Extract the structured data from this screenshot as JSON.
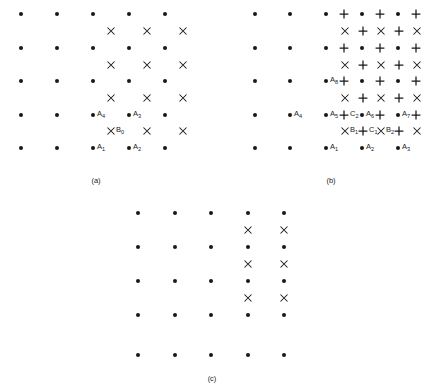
{
  "figure": {
    "background_color": "#ffffff",
    "mark_color": "#181818",
    "panels": [
      {
        "id": "panel-a",
        "caption": "(a)",
        "caption_x": 96,
        "caption_y": 176,
        "dots": [
          {
            "x": 21,
            "y": 14
          },
          {
            "x": 57,
            "y": 14
          },
          {
            "x": 93,
            "y": 14
          },
          {
            "x": 129,
            "y": 14
          },
          {
            "x": 165,
            "y": 14
          },
          {
            "x": 21,
            "y": 48
          },
          {
            "x": 57,
            "y": 48
          },
          {
            "x": 93,
            "y": 48
          },
          {
            "x": 129,
            "y": 48
          },
          {
            "x": 165,
            "y": 48
          },
          {
            "x": 21,
            "y": 81
          },
          {
            "x": 57,
            "y": 81
          },
          {
            "x": 93,
            "y": 81
          },
          {
            "x": 129,
            "y": 81
          },
          {
            "x": 165,
            "y": 81
          },
          {
            "x": 21,
            "y": 115
          },
          {
            "x": 57,
            "y": 115
          },
          {
            "x": 93,
            "y": 115
          },
          {
            "x": 129,
            "y": 115
          },
          {
            "x": 165,
            "y": 115
          },
          {
            "x": 21,
            "y": 148
          },
          {
            "x": 57,
            "y": 148
          },
          {
            "x": 93,
            "y": 148
          },
          {
            "x": 129,
            "y": 148
          },
          {
            "x": 165,
            "y": 148
          }
        ],
        "crosses": [
          {
            "x": 111,
            "y": 31
          },
          {
            "x": 147,
            "y": 31
          },
          {
            "x": 183,
            "y": 31
          },
          {
            "x": 111,
            "y": 65
          },
          {
            "x": 147,
            "y": 65
          },
          {
            "x": 183,
            "y": 65
          },
          {
            "x": 111,
            "y": 98
          },
          {
            "x": 147,
            "y": 98
          },
          {
            "x": 183,
            "y": 98
          },
          {
            "x": 111,
            "y": 131
          },
          {
            "x": 147,
            "y": 131
          },
          {
            "x": 183,
            "y": 131
          }
        ],
        "pluses": [],
        "labels": [
          {
            "text": "A",
            "sub": "4",
            "x": 97,
            "y": 115
          },
          {
            "text": "A",
            "sub": "3",
            "x": 133,
            "y": 115
          },
          {
            "text": "B",
            "sub": "0",
            "x": 116,
            "y": 131
          },
          {
            "text": "A",
            "sub": "1",
            "x": 97,
            "y": 148
          },
          {
            "text": "A",
            "sub": "2",
            "x": 133,
            "y": 148
          }
        ]
      },
      {
        "id": "panel-b",
        "caption": "(b)",
        "caption_x": 331,
        "caption_y": 176,
        "dots": [
          {
            "x": 255,
            "y": 14
          },
          {
            "x": 290,
            "y": 14
          },
          {
            "x": 326,
            "y": 14
          },
          {
            "x": 362,
            "y": 14
          },
          {
            "x": 398,
            "y": 14
          },
          {
            "x": 255,
            "y": 48
          },
          {
            "x": 290,
            "y": 48
          },
          {
            "x": 326,
            "y": 48
          },
          {
            "x": 362,
            "y": 48
          },
          {
            "x": 398,
            "y": 48
          },
          {
            "x": 255,
            "y": 81
          },
          {
            "x": 290,
            "y": 81
          },
          {
            "x": 326,
            "y": 81
          },
          {
            "x": 362,
            "y": 81
          },
          {
            "x": 398,
            "y": 81
          },
          {
            "x": 255,
            "y": 115
          },
          {
            "x": 290,
            "y": 115
          },
          {
            "x": 326,
            "y": 115
          },
          {
            "x": 362,
            "y": 115
          },
          {
            "x": 398,
            "y": 115
          },
          {
            "x": 255,
            "y": 148
          },
          {
            "x": 290,
            "y": 148
          },
          {
            "x": 326,
            "y": 148
          },
          {
            "x": 362,
            "y": 148
          },
          {
            "x": 398,
            "y": 148
          }
        ],
        "crosses": [
          {
            "x": 345,
            "y": 31
          },
          {
            "x": 381,
            "y": 31
          },
          {
            "x": 417,
            "y": 31
          },
          {
            "x": 345,
            "y": 65
          },
          {
            "x": 381,
            "y": 65
          },
          {
            "x": 417,
            "y": 65
          },
          {
            "x": 345,
            "y": 98
          },
          {
            "x": 381,
            "y": 98
          },
          {
            "x": 417,
            "y": 98
          },
          {
            "x": 345,
            "y": 131
          },
          {
            "x": 381,
            "y": 131
          },
          {
            "x": 417,
            "y": 131
          }
        ],
        "pluses": [
          {
            "x": 344,
            "y": 14
          },
          {
            "x": 380,
            "y": 14
          },
          {
            "x": 416,
            "y": 14
          },
          {
            "x": 363,
            "y": 31
          },
          {
            "x": 399,
            "y": 31
          },
          {
            "x": 344,
            "y": 48
          },
          {
            "x": 380,
            "y": 48
          },
          {
            "x": 416,
            "y": 48
          },
          {
            "x": 363,
            "y": 65
          },
          {
            "x": 399,
            "y": 65
          },
          {
            "x": 344,
            "y": 81
          },
          {
            "x": 380,
            "y": 81
          },
          {
            "x": 416,
            "y": 81
          },
          {
            "x": 363,
            "y": 98
          },
          {
            "x": 399,
            "y": 98
          },
          {
            "x": 344,
            "y": 115
          },
          {
            "x": 380,
            "y": 115
          },
          {
            "x": 416,
            "y": 115
          },
          {
            "x": 363,
            "y": 131
          },
          {
            "x": 399,
            "y": 131
          }
        ],
        "labels": [
          {
            "text": "A",
            "sub": "8",
            "x": 330,
            "y": 81
          },
          {
            "text": "A",
            "sub": "4",
            "x": 294,
            "y": 115
          },
          {
            "text": "A",
            "sub": "5",
            "x": 330,
            "y": 115
          },
          {
            "text": "C",
            "sub": "2",
            "x": 350,
            "y": 115
          },
          {
            "text": "A",
            "sub": "6",
            "x": 366,
            "y": 115
          },
          {
            "text": "A",
            "sub": "7",
            "x": 402,
            "y": 115
          },
          {
            "text": "B",
            "sub": "1",
            "x": 350,
            "y": 131
          },
          {
            "text": "C",
            "sub": "1",
            "x": 369,
            "y": 131
          },
          {
            "text": "B",
            "sub": "2",
            "x": 386,
            "y": 131
          },
          {
            "text": "A",
            "sub": "1",
            "x": 330,
            "y": 148
          },
          {
            "text": "A",
            "sub": "2",
            "x": 366,
            "y": 148
          },
          {
            "text": "A",
            "sub": "3",
            "x": 402,
            "y": 148
          }
        ]
      },
      {
        "id": "panel-c",
        "caption": "(c)",
        "caption_x": 212,
        "caption_y": 374,
        "dots": [
          {
            "x": 138,
            "y": 213
          },
          {
            "x": 175,
            "y": 213
          },
          {
            "x": 211,
            "y": 213
          },
          {
            "x": 248,
            "y": 213
          },
          {
            "x": 284,
            "y": 213
          },
          {
            "x": 138,
            "y": 247
          },
          {
            "x": 175,
            "y": 247
          },
          {
            "x": 211,
            "y": 247
          },
          {
            "x": 248,
            "y": 247
          },
          {
            "x": 284,
            "y": 247
          },
          {
            "x": 138,
            "y": 281
          },
          {
            "x": 175,
            "y": 281
          },
          {
            "x": 211,
            "y": 281
          },
          {
            "x": 248,
            "y": 281
          },
          {
            "x": 284,
            "y": 281
          },
          {
            "x": 138,
            "y": 315
          },
          {
            "x": 175,
            "y": 315
          },
          {
            "x": 211,
            "y": 315
          },
          {
            "x": 248,
            "y": 315
          },
          {
            "x": 284,
            "y": 315
          },
          {
            "x": 138,
            "y": 355
          },
          {
            "x": 175,
            "y": 355
          },
          {
            "x": 211,
            "y": 355
          },
          {
            "x": 248,
            "y": 355
          },
          {
            "x": 284,
            "y": 355
          }
        ],
        "crosses": [
          {
            "x": 248,
            "y": 230
          },
          {
            "x": 284,
            "y": 230
          },
          {
            "x": 248,
            "y": 264
          },
          {
            "x": 284,
            "y": 264
          },
          {
            "x": 248,
            "y": 298
          },
          {
            "x": 284,
            "y": 298
          }
        ],
        "pluses": [],
        "labels": []
      }
    ]
  }
}
